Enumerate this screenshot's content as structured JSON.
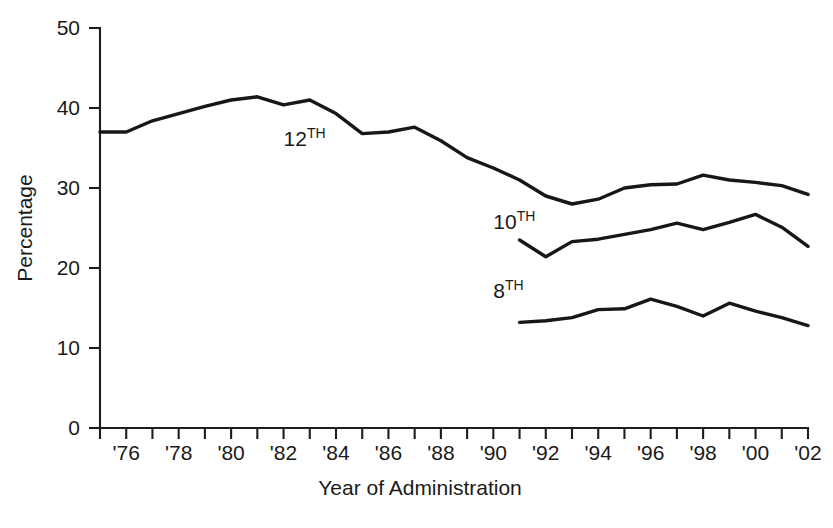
{
  "chart_data": {
    "type": "line",
    "title": "",
    "subtitle": "",
    "xlabel": "Year of Administration",
    "ylabel": "Percentage",
    "xlim": [
      1975,
      2002
    ],
    "ylim": [
      0,
      50
    ],
    "yticks": [
      0,
      10,
      20,
      30,
      40,
      50
    ],
    "ytick_labels": [
      "0",
      "10",
      "20",
      "30",
      "40",
      "50"
    ],
    "xticks": [
      1975,
      1976,
      1977,
      1978,
      1979,
      1980,
      1981,
      1982,
      1983,
      1984,
      1985,
      1986,
      1987,
      1988,
      1989,
      1990,
      1991,
      1992,
      1993,
      1994,
      1995,
      1996,
      1997,
      1998,
      1999,
      2000,
      2001,
      2002
    ],
    "xtick_labels": [
      "",
      "'76",
      "",
      "'78",
      "",
      "'80",
      "",
      "'82",
      "",
      "'84",
      "",
      "'86",
      "",
      "'88",
      "",
      "'90",
      "",
      "'92",
      "",
      "'94",
      "",
      "'96",
      "",
      "'98",
      "",
      "'00",
      "",
      "'02"
    ],
    "grid": false,
    "legend_position": "inline-annotations",
    "series": [
      {
        "name": "12TH",
        "label_base": "12",
        "label_sup": "TH",
        "color": "#17171a",
        "x": [
          1975,
          1976,
          1977,
          1978,
          1979,
          1980,
          1981,
          1982,
          1983,
          1984,
          1985,
          1986,
          1987,
          1988,
          1989,
          1990,
          1991,
          1992,
          1993,
          1994,
          1995,
          1996,
          1997,
          1998,
          1999,
          2000,
          2001,
          2002
        ],
        "values": [
          37.0,
          37.0,
          38.4,
          39.3,
          40.2,
          41.0,
          41.4,
          40.4,
          41.0,
          39.3,
          36.8,
          37.0,
          37.6,
          35.9,
          33.8,
          32.5,
          31.0,
          29.0,
          28.0,
          28.6,
          30.0,
          30.4,
          30.5,
          31.6,
          31.0,
          30.7,
          30.3,
          29.2
        ]
      },
      {
        "name": "10TH",
        "label_base": "10",
        "label_sup": "TH",
        "color": "#17171a",
        "x": [
          1991,
          1992,
          1993,
          1994,
          1995,
          1996,
          1997,
          1998,
          1999,
          2000,
          2001,
          2002
        ],
        "values": [
          23.5,
          21.4,
          23.3,
          23.6,
          24.2,
          24.8,
          25.6,
          24.8,
          25.7,
          26.7,
          25.1,
          22.7
        ]
      },
      {
        "name": "8TH",
        "label_base": "8",
        "label_sup": "TH",
        "color": "#17171a",
        "x": [
          1991,
          1992,
          1993,
          1994,
          1995,
          1996,
          1997,
          1998,
          1999,
          2000,
          2001,
          2002
        ],
        "values": [
          13.2,
          13.4,
          13.8,
          14.8,
          14.9,
          16.1,
          15.2,
          14.0,
          15.6,
          14.6,
          13.8,
          12.8
        ]
      }
    ],
    "annotations": [
      {
        "name": "series-label-12th",
        "text_base": "12",
        "text_sup": "TH",
        "x": 1982,
        "y": 35.2
      },
      {
        "name": "series-label-10th",
        "text_base": "10",
        "text_sup": "TH",
        "x": 1990,
        "y": 24.9
      },
      {
        "name": "series-label-8th",
        "text_base": "8",
        "text_sup": "TH",
        "x": 1990,
        "y": 16.2
      }
    ]
  },
  "axes": {
    "y_title": "Percentage",
    "x_title": "Year of Administration"
  }
}
